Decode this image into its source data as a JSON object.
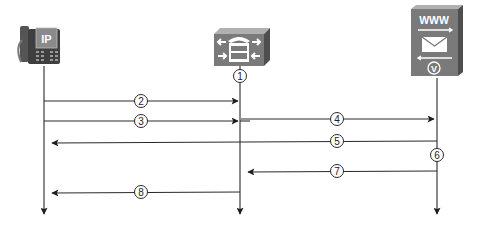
{
  "diagram": {
    "type": "sequence",
    "colors": {
      "line": "#2a2a2a",
      "device_face": "#7a7a7a",
      "device_side": "#4e4e4e",
      "device_top": "#a5a5a5",
      "label_bg": "#ffffff"
    },
    "participants": [
      {
        "id": "ip-phone",
        "name": "IP Phone",
        "icon": "ip-phone-icon",
        "badge": "IP",
        "x": 44
      },
      {
        "id": "call-agent",
        "name": "Call Manager",
        "icon": "call-manager-icon",
        "x": 240
      },
      {
        "id": "voicemail-server",
        "name": "Voice Mail Server",
        "icon": "voicemail-server-icon",
        "badge": "WWW",
        "sub_badge": "V",
        "x": 437
      }
    ],
    "steps": [
      {
        "label": "1",
        "kind": "marker",
        "on": "call-agent",
        "y": 76
      },
      {
        "label": "2",
        "kind": "message",
        "from": "ip-phone",
        "to": "call-agent",
        "y": 101
      },
      {
        "label": "3",
        "kind": "message",
        "from": "ip-phone",
        "to": "call-agent",
        "y": 121
      },
      {
        "label": "4",
        "kind": "message",
        "from": "call-agent",
        "to": "voicemail-server",
        "y": 119
      },
      {
        "label": "5",
        "kind": "message",
        "from": "voicemail-server",
        "to": "ip-phone",
        "y": 141
      },
      {
        "label": "6",
        "kind": "marker",
        "on": "voicemail-server",
        "y": 155
      },
      {
        "label": "7",
        "kind": "message",
        "from": "voicemail-server",
        "to": "call-agent",
        "y": 171
      },
      {
        "label": "8",
        "kind": "message",
        "from": "call-agent",
        "to": "ip-phone",
        "y": 192
      }
    ]
  }
}
